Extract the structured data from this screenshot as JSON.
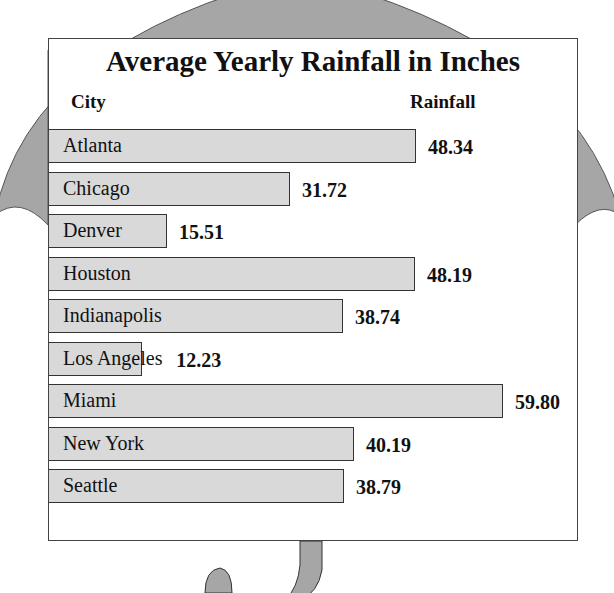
{
  "chart_data": {
    "type": "bar",
    "orientation": "horizontal",
    "title": "Average Yearly Rainfall in Inches",
    "xlabel": "Rainfall",
    "ylabel": "City",
    "categories": [
      "Atlanta",
      "Chicago",
      "Denver",
      "Houston",
      "Indianapolis",
      "Los Angeles",
      "Miami",
      "New York",
      "Seattle"
    ],
    "values": [
      48.34,
      31.72,
      15.51,
      48.19,
      38.74,
      12.23,
      59.8,
      40.19,
      38.79
    ],
    "value_labels": [
      "48.34",
      "31.72",
      "15.51",
      "48.19",
      "38.74",
      "12.23",
      "59.80",
      "40.19",
      "38.79"
    ],
    "grid": false,
    "legend": null,
    "bar_color": "#d9d9d9",
    "background_decoration": "umbrella silhouette"
  },
  "header": {
    "city": "City",
    "rainfall": "Rainfall"
  },
  "colors": {
    "bar": "#d9d9d9",
    "umbrella": "#a6a6a6",
    "border": "#333333"
  }
}
